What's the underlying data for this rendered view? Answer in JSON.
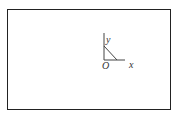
{
  "diagram": {
    "axes": {
      "origin_label": "O",
      "x_label": "x",
      "y_label": "y"
    },
    "colors": {
      "border": "#222222",
      "line": "#444444",
      "text": "#333333"
    }
  }
}
